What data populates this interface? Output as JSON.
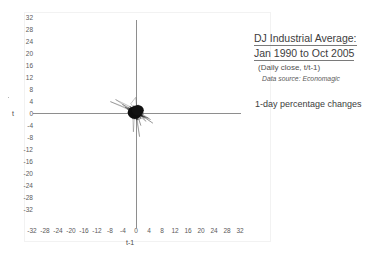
{
  "chart_data": {
    "type": "scatter",
    "title": "DJ Industrial Average: Jan 1990 to Oct 2005",
    "subtitle": "(Daily close, t/t-1)",
    "source": "Data source: Economagic",
    "note": "1-day percentage changes",
    "xlabel": "t-1",
    "ylabel": "t",
    "xlim": [
      -32,
      32
    ],
    "ylim": [
      -32,
      32
    ],
    "xticks": [
      -32,
      -28,
      -24,
      -20,
      -16,
      -12,
      -8,
      -4,
      0,
      4,
      8,
      12,
      16,
      20,
      24,
      28,
      32
    ],
    "yticks": [
      32,
      28,
      24,
      20,
      16,
      12,
      8,
      4,
      0,
      -4,
      -8,
      -12,
      -16,
      -20,
      -24,
      -28,
      -32
    ],
    "grid": false,
    "legend": false,
    "marker_style": "connected-line-trajectory",
    "data_extent": {
      "x": [
        -8,
        6
      ],
      "y": [
        -8,
        6
      ]
    },
    "series": [
      {
        "name": "DJIA daily % change (t vs t-1)",
        "color": "#111111",
        "x": [
          0.4,
          -0.3,
          0.8,
          -1.1,
          0.6,
          0.2,
          -0.5,
          1.3,
          -0.9,
          0.7,
          -0.2,
          0.5,
          -1.4,
          0.9,
          0.1,
          -0.6,
          1.0,
          -0.4,
          0.3,
          -0.8,
          1.6,
          -1.9,
          2.2,
          -0.7,
          0.4,
          -0.1,
          0.9,
          -1.2,
          0.6,
          0.3,
          -2.4,
          1.8,
          -0.5,
          0.2,
          0.7,
          -0.9,
          1.1,
          -0.3,
          0.5,
          -1.6,
          3.1,
          -2.8,
          1.4,
          -0.6,
          0.8,
          -0.2,
          0.4,
          -1.0,
          1.7,
          -0.8,
          0.3,
          0.6,
          -0.4,
          1.2,
          -2.1,
          0.9,
          -0.3,
          0.5,
          -0.7,
          1.5,
          -4.2,
          2.9,
          -1.3,
          0.8,
          -0.5,
          1.1,
          -0.9,
          0.4,
          -0.2,
          0.7,
          -1.8,
          2.3,
          -0.6,
          0.3,
          0.9,
          -1.1,
          0.5,
          -0.4,
          1.3,
          -0.8,
          -6.3,
          4.5,
          -2.2,
          1.6,
          -0.9,
          0.7,
          -0.3,
          1.0,
          -1.5,
          0.6,
          0.2,
          -0.8,
          1.4,
          -0.5,
          0.3,
          -1.2,
          0.9,
          -0.4,
          0.6,
          -0.1,
          5.2,
          -3.4,
          1.9,
          -1.1,
          0.5,
          -0.7,
          1.2,
          -0.3,
          0.8,
          -1.6,
          0.4,
          0.9,
          -0.6,
          1.5,
          -2.0,
          0.7,
          -0.4,
          0.3,
          -0.9,
          1.1,
          -7.9,
          3.8,
          -1.7,
          0.9,
          -0.4,
          1.3,
          -0.8,
          0.5,
          -0.2,
          0.6,
          -1.4,
          1.8,
          -0.7,
          0.2,
          0.8,
          -1.0,
          0.4,
          -0.5,
          1.2,
          -0.6,
          2.6,
          -1.8,
          0.9,
          -0.3,
          0.7,
          -1.1,
          0.5,
          0.2,
          -0.8,
          1.0,
          -0.4,
          0.6,
          -1.3,
          0.9,
          -0.2,
          0.4,
          -0.7,
          1.4,
          -0.9,
          0.3
        ],
        "y": [
          -0.3,
          0.8,
          -1.1,
          0.6,
          0.2,
          -0.5,
          1.3,
          -0.9,
          0.7,
          -0.2,
          0.5,
          -1.4,
          0.9,
          0.1,
          -0.6,
          1.0,
          -0.4,
          0.3,
          -0.8,
          1.6,
          -1.9,
          2.2,
          -0.7,
          0.4,
          -0.1,
          0.9,
          -1.2,
          0.6,
          0.3,
          -2.4,
          1.8,
          -0.5,
          0.2,
          0.7,
          -0.9,
          1.1,
          -0.3,
          0.5,
          -1.6,
          3.1,
          -2.8,
          1.4,
          -0.6,
          0.8,
          -0.2,
          0.4,
          -1.0,
          1.7,
          -0.8,
          0.3,
          0.6,
          -0.4,
          1.2,
          -2.1,
          0.9,
          -0.3,
          0.5,
          -0.7,
          1.5,
          -4.2,
          2.9,
          -1.3,
          0.8,
          -0.5,
          1.1,
          -0.9,
          0.4,
          -0.2,
          0.7,
          -1.8,
          2.3,
          -0.6,
          0.3,
          0.9,
          -1.1,
          0.5,
          -0.4,
          1.3,
          -0.8,
          -6.3,
          4.5,
          -2.2,
          1.6,
          -0.9,
          0.7,
          -0.3,
          1.0,
          -1.5,
          0.6,
          0.2,
          -0.8,
          1.4,
          -0.5,
          0.3,
          -1.2,
          0.9,
          -0.4,
          0.6,
          -0.1,
          5.2,
          -3.4,
          1.9,
          -1.1,
          0.5,
          -0.7,
          1.2,
          -0.3,
          0.8,
          -1.6,
          0.4,
          0.9,
          -0.6,
          1.5,
          -2.0,
          0.7,
          -0.4,
          0.3,
          -0.9,
          1.1,
          -7.9,
          3.8,
          -1.7,
          0.9,
          -0.4,
          1.3,
          -0.8,
          0.5,
          -0.2,
          0.6,
          -1.4,
          1.8,
          -0.7,
          0.2,
          0.8,
          -1.0,
          0.4,
          -0.5,
          1.2,
          -0.6,
          2.6,
          -1.8,
          0.9,
          -0.3,
          0.7,
          -1.1,
          0.5,
          0.2,
          -0.8,
          1.0,
          -0.4,
          0.6,
          -1.3,
          0.9,
          -0.2,
          0.4,
          -0.7,
          1.4,
          -0.9,
          0.3,
          0.5
        ]
      }
    ]
  },
  "annotation": {
    "title_line1": "DJ Industrial Average:",
    "title_line2": "Jan 1990 to Oct 2005",
    "subtitle": "(Daily close, t/t-1)",
    "source": "Data source: Economagic",
    "note": "1-day percentage changes"
  },
  "axes": {
    "xlabel": "t-1",
    "ylabel": "t"
  }
}
